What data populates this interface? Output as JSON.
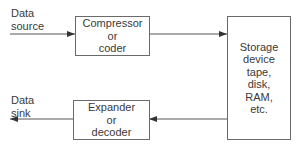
{
  "diagram": {
    "source_label": [
      "Data",
      "source"
    ],
    "sink_label": [
      "Data",
      "sink"
    ],
    "compressor": [
      "Compressor",
      "or",
      "coder"
    ],
    "expander": [
      "Expander",
      "or",
      "decoder"
    ],
    "storage": [
      "Storage",
      "device",
      "tape,",
      "disk,",
      "RAM,",
      "etc."
    ],
    "line_color": "#555555"
  }
}
